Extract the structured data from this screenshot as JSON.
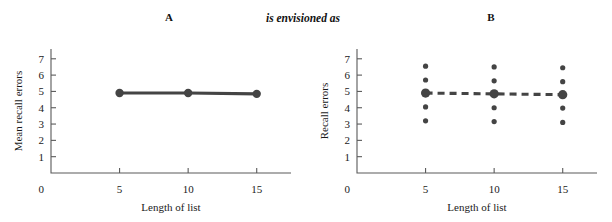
{
  "figure": {
    "panel_a_label": "A",
    "panel_b_label": "B",
    "connector_text": "is envisioned as"
  },
  "colors": {
    "data": "#444444",
    "axis": "#5a5a5a",
    "text": "#1a1a1a",
    "background": "#ffffff"
  },
  "chart_data": [
    {
      "type": "line",
      "panel": "A",
      "title": "A",
      "xlabel": "Length of list",
      "ylabel": "Mean recall errors",
      "x": [
        5,
        10,
        15
      ],
      "values": [
        4.9,
        4.9,
        4.85
      ],
      "categories": [
        "5",
        "10",
        "15"
      ],
      "xlim": [
        0,
        17.5
      ],
      "ylim": [
        0,
        7.6
      ],
      "xticks": [
        5,
        10,
        15
      ],
      "xtick_labels": [
        "5",
        "10",
        "15"
      ],
      "yticks": [
        1,
        2,
        3,
        4,
        5,
        6,
        7
      ],
      "ytick_labels": [
        "1",
        "2",
        "3",
        "4",
        "5",
        "6",
        "7"
      ],
      "origin_label": "0",
      "grid": false,
      "legend": "none",
      "line_style": "solid",
      "marker": "circle"
    },
    {
      "type": "scatter",
      "panel": "B",
      "title": "B",
      "xlabel": "Length of list",
      "ylabel": "Recall errors",
      "x": [
        5,
        10,
        15
      ],
      "categories": [
        "5",
        "10",
        "15"
      ],
      "xlim": [
        0,
        17.5
      ],
      "ylim": [
        0,
        7.6
      ],
      "xticks": [
        5,
        10,
        15
      ],
      "xtick_labels": [
        "5",
        "10",
        "15"
      ],
      "yticks": [
        1,
        2,
        3,
        4,
        5,
        6,
        7
      ],
      "ytick_labels": [
        "1",
        "2",
        "3",
        "4",
        "5",
        "6",
        "7"
      ],
      "origin_label": "0",
      "grid": false,
      "legend": "none",
      "line_style": "dashed",
      "observations": [
        {
          "x": 5,
          "values": [
            6.55,
            5.7,
            4.9,
            4.05,
            3.2
          ]
        },
        {
          "x": 10,
          "values": [
            6.5,
            5.65,
            4.85,
            4.0,
            3.15
          ]
        },
        {
          "x": 15,
          "values": [
            6.45,
            5.6,
            4.8,
            3.98,
            3.1
          ]
        }
      ],
      "means": [
        4.9,
        4.85,
        4.8
      ]
    }
  ]
}
